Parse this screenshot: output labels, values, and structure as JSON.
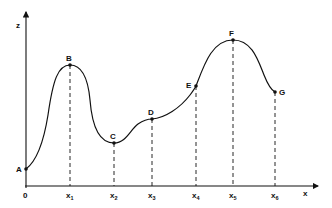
{
  "diagram": {
    "axes": {
      "x_label": "x",
      "y_label": "z",
      "origin_label": "0"
    },
    "ticks": [
      {
        "base": "x",
        "sub": "1"
      },
      {
        "base": "x",
        "sub": "2"
      },
      {
        "base": "x",
        "sub": "3"
      },
      {
        "base": "x",
        "sub": "4"
      },
      {
        "base": "x",
        "sub": "5"
      },
      {
        "base": "x",
        "sub": "6"
      }
    ],
    "points": [
      {
        "label": "A"
      },
      {
        "label": "B"
      },
      {
        "label": "C"
      },
      {
        "label": "D"
      },
      {
        "label": "E"
      },
      {
        "label": "F"
      },
      {
        "label": "G"
      }
    ],
    "colors": {
      "line": "#111111",
      "background": "#ffffff"
    }
  }
}
